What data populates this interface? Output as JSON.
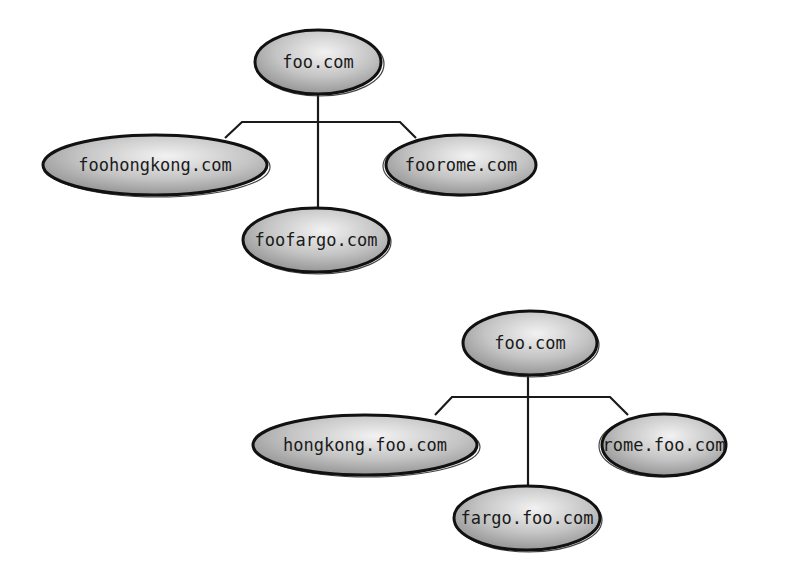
{
  "diagrams": [
    {
      "name": "flat-domains",
      "root": {
        "label": "foo.com",
        "cx": 318,
        "cy": 62,
        "rx": 63,
        "ry": 32
      },
      "bus_y": 122,
      "children": [
        {
          "label": "foohongkong.com",
          "cx": 155,
          "cy": 165,
          "rx": 112,
          "ry": 30,
          "attach_x": 242
        },
        {
          "label": "foofargo.com",
          "cx": 316,
          "cy": 240,
          "rx": 73,
          "ry": 32,
          "attach_x": 318
        },
        {
          "label": "foorome.com",
          "cx": 461,
          "cy": 165,
          "rx": 75,
          "ry": 30,
          "attach_x": 400
        }
      ]
    },
    {
      "name": "subdomains",
      "root": {
        "label": "foo.com",
        "cx": 530,
        "cy": 343,
        "rx": 67,
        "ry": 32
      },
      "bus_y": 397,
      "children": [
        {
          "label": "hongkong.foo.com",
          "cx": 365,
          "cy": 445,
          "rx": 112,
          "ry": 30,
          "attach_x": 452
        },
        {
          "label": "fargo.foo.com",
          "cx": 527,
          "cy": 518,
          "rx": 73,
          "ry": 32,
          "attach_x": 528
        },
        {
          "label": "rome.foo.com",
          "cx": 664,
          "cy": 445,
          "rx": 62,
          "ry": 31,
          "attach_x": 610
        }
      ]
    }
  ],
  "colors": {
    "node_fill_light": "#ededed",
    "node_fill_dark": "#9c9c9c",
    "node_stroke": "#111111",
    "line": "#1a1a1a",
    "background": "#ffffff"
  }
}
